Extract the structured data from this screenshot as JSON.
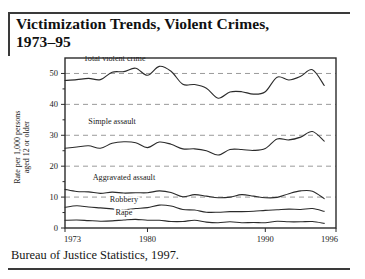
{
  "figure": {
    "title": "Victimization Trends, Violent Crimes, 1973–95",
    "title_line1": "Victimization Trends, Violent Crimes,",
    "title_line2": "1973–95",
    "source": "Bureau of Justice Statistics, 1997."
  },
  "axis": {
    "ylabel_line1": "Rate per 1,000 persons",
    "ylabel_line2": "aged 12 or older",
    "ytick_labels": [
      "0",
      "10",
      "20",
      "30",
      "40",
      "50"
    ],
    "xtick_labels": [
      "1973",
      "1980",
      "1990",
      "1996"
    ]
  },
  "series_labels": {
    "total": "Total violent crime",
    "simple": "Simple assault",
    "aggravated": "Aggravated assault",
    "robbery": "Robbery",
    "rape": "Rape"
  },
  "colors": {
    "line": "#2b2b2b",
    "grid": "#9a9a9a",
    "frame": "#2b2b2b",
    "text": "#1a1a1a",
    "rule": "#3a3a3a",
    "background": "#ffffff"
  },
  "chart_data": {
    "type": "line",
    "title": "Victimization Trends, Violent Crimes, 1973–95",
    "xlabel": "",
    "ylabel": "Rate per 1,000 persons aged 12 or older",
    "xlim": [
      1973,
      1996
    ],
    "ylim": [
      0,
      55
    ],
    "ytick_values": [
      0,
      10,
      20,
      30,
      40,
      50
    ],
    "ytick_minor": [
      5,
      15,
      25,
      35,
      45
    ],
    "xtick_values": [
      1973,
      1980,
      1990,
      1996
    ],
    "grid": "horizontal-dashed-at-major-ticks",
    "legend": "inline-labels",
    "x": [
      1973,
      1974,
      1975,
      1976,
      1977,
      1978,
      1979,
      1980,
      1981,
      1982,
      1983,
      1984,
      1985,
      1986,
      1987,
      1988,
      1989,
      1990,
      1991,
      1992,
      1993,
      1994,
      1995
    ],
    "series": [
      {
        "name": "Total violent crime",
        "label_position": {
          "x": 1977.2,
          "y": 54.0
        },
        "values": [
          47.7,
          48.0,
          48.4,
          48.0,
          50.4,
          50.6,
          51.7,
          49.4,
          52.3,
          50.7,
          46.5,
          46.4,
          45.2,
          42.0,
          44.0,
          44.1,
          43.3,
          44.1,
          48.8,
          47.9,
          49.1,
          51.2,
          46.1
        ]
      },
      {
        "name": "Simple assault",
        "label_position": {
          "x": 1977.0,
          "y": 33.5
        },
        "values": [
          25.8,
          26.2,
          26.6,
          25.8,
          27.4,
          27.9,
          27.6,
          26.0,
          27.8,
          27.1,
          25.6,
          25.6,
          25.0,
          23.6,
          25.4,
          25.4,
          25.1,
          25.7,
          28.8,
          28.5,
          29.4,
          31.2,
          28.1
        ]
      },
      {
        "name": "Aggravated assault",
        "label_position": {
          "x": 1978.0,
          "y": 15.6
        },
        "values": [
          12.5,
          11.8,
          11.7,
          11.2,
          11.6,
          11.3,
          11.4,
          11.4,
          12.0,
          11.5,
          10.1,
          10.8,
          10.3,
          9.8,
          10.0,
          10.8,
          10.3,
          9.8,
          9.9,
          11.1,
          12.0,
          11.9,
          9.5
        ]
      },
      {
        "name": "Robbery",
        "label_position": {
          "x": 1978.0,
          "y": 8.3
        },
        "values": [
          6.7,
          7.2,
          6.8,
          6.5,
          6.2,
          5.9,
          6.3,
          6.6,
          7.4,
          7.1,
          6.0,
          5.8,
          5.1,
          5.1,
          5.3,
          5.3,
          5.4,
          5.7,
          5.9,
          6.1,
          6.0,
          6.3,
          5.4
        ]
      },
      {
        "name": "Rape",
        "label_position": {
          "x": 1978.0,
          "y": 4.3
        },
        "values": [
          2.5,
          2.6,
          2.4,
          2.2,
          2.3,
          2.6,
          2.8,
          2.5,
          2.5,
          2.1,
          2.1,
          2.5,
          1.9,
          1.7,
          2.0,
          1.7,
          1.8,
          1.7,
          2.2,
          2.0,
          2.0,
          2.1,
          1.5
        ]
      }
    ]
  }
}
